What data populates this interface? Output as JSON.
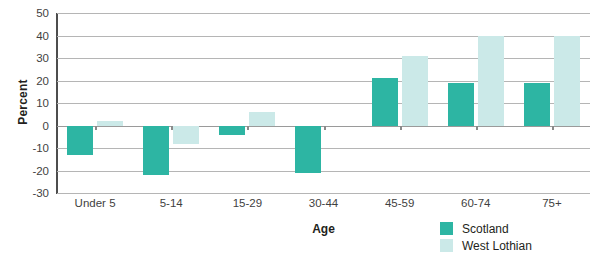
{
  "chart_data": {
    "type": "bar",
    "title": "",
    "xlabel": "Age",
    "ylabel": "Percent",
    "categories": [
      "Under 5",
      "5-14",
      "15-29",
      "30-44",
      "45-59",
      "60-74",
      "75+"
    ],
    "series": [
      {
        "name": "Scotland",
        "color": "#2db5a3",
        "values": [
          -13,
          -22,
          -4,
          -21,
          21,
          19,
          19
        ]
      },
      {
        "name": "West Lothian",
        "color": "#cbe9e8",
        "values": [
          2,
          -8,
          6,
          0,
          31,
          40,
          40
        ]
      }
    ],
    "ylim": [
      -30,
      50
    ],
    "yticks": [
      50,
      40,
      30,
      20,
      10,
      0,
      -10,
      -20,
      -30
    ],
    "grid": true,
    "legend_position": "bottom-right"
  },
  "colors": {
    "scotland": "#2db5a3",
    "west_lothian": "#cbe9e8",
    "gridline": "#b5b5b5",
    "axis": "#4d4d4d",
    "text": "#231f20"
  }
}
